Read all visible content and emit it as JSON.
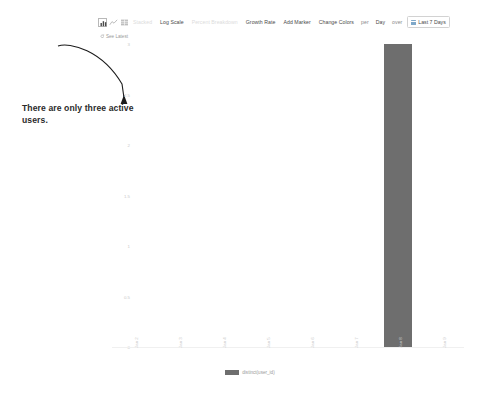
{
  "toolbar": {
    "icons": [
      {
        "name": "bar-chart-icon",
        "selected": true
      },
      {
        "name": "line-chart-icon",
        "selected": false
      },
      {
        "name": "table-view-icon",
        "selected": false
      }
    ],
    "stacked_label": "Stacked",
    "log_scale_label": "Log Scale",
    "percent_breakdown_label": "Percent Breakdown",
    "growth_rate_label": "Growth Rate",
    "add_marker_label": "Add Marker",
    "change_colors_label": "Change Colors",
    "per_label": "per",
    "interval_label": "Day",
    "over_label": "over",
    "date_range_label": "Last 7 Days"
  },
  "see_latest": {
    "label": "See Latest"
  },
  "annotation": {
    "text": "There are only three active users."
  },
  "legend": {
    "entries": [
      {
        "label": "distinct(user_id)",
        "color": "#6e6e6e"
      }
    ]
  },
  "chart_data": {
    "type": "bar",
    "title": "",
    "xlabel": "",
    "ylabel": "",
    "ylim": [
      0,
      3
    ],
    "yticks": [
      "3",
      "2.5",
      "2",
      "1.5",
      "1",
      "0.5",
      "0"
    ],
    "ytick_values": [
      3,
      2.5,
      2,
      1.5,
      1,
      0.5,
      0
    ],
    "grid": false,
    "legend_position": "bottom",
    "categories": [
      "Jan 2",
      "Jan 3",
      "Jan 4",
      "Jan 5",
      "Jan 6",
      "Jan 7",
      "Jan 8",
      "Jan 9"
    ],
    "series": [
      {
        "name": "distinct(user_id)",
        "color": "#6e6e6e",
        "values": [
          0,
          0,
          0,
          0,
          0,
          0,
          3,
          0
        ]
      }
    ]
  },
  "colors": {
    "bar": "#6e6e6e",
    "axis_text": "#c9c9c9",
    "annotation_text": "#2b2b2b",
    "toolbar_text": "#4a4a4a",
    "toolbar_dim": "#dcdcdc"
  }
}
